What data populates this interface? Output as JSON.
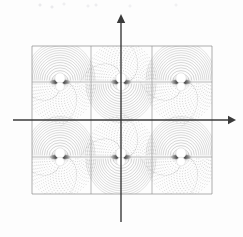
{
  "figure": {
    "title": "",
    "background_color": "#fdfdfd",
    "width": 243,
    "height": 237
  },
  "axes": {
    "color": "#3a3a3a",
    "x_axis": {
      "name": "horizontal-axis",
      "label": "",
      "y": 120,
      "x_start": 13,
      "x_end": 236,
      "arrow": "right"
    },
    "y_axis": {
      "name": "vertical-axis",
      "label": "",
      "x": 121,
      "y_start": 222,
      "y_end": 14,
      "arrow": "up"
    }
  },
  "lattice": {
    "name": "unit-cell-grid",
    "border_color": "#8a8a8a",
    "grid_color": "#9a9a9a",
    "x_bounds": [
      32,
      91,
      152,
      212
    ],
    "y_bounds": [
      46,
      82,
      157,
      194
    ],
    "columns": 3,
    "rows": 3,
    "mid_row_split_y": 120
  },
  "chart_data": {
    "type": "contour",
    "title": "",
    "subtitle": "",
    "xlabel": "",
    "ylabel": "",
    "grid": true,
    "legend": null,
    "contour_style": {
      "solid_line_color": "#9b9b9b",
      "dotted_line_color": "#8f8f8f",
      "core_dark_color": "#1a1a1a",
      "disk_fill": "#ffffff",
      "line_width": 0.5
    },
    "dipole_sites": [
      {
        "id": "site-0",
        "col": 0,
        "row": 0,
        "cx": 60,
        "cy": 82,
        "polarity": "up",
        "contour_style_above": "solid",
        "contour_style_below": "dotted"
      },
      {
        "id": "site-1",
        "col": 1,
        "row": 0,
        "cx": 121,
        "cy": 82,
        "polarity": "down",
        "contour_style_above": "dotted",
        "contour_style_below": "solid"
      },
      {
        "id": "site-2",
        "col": 2,
        "row": 0,
        "cx": 181,
        "cy": 82,
        "polarity": "up",
        "contour_style_above": "solid",
        "contour_style_below": "dotted"
      },
      {
        "id": "site-3",
        "col": 0,
        "row": 1,
        "cx": 60,
        "cy": 157,
        "polarity": "up",
        "contour_style_above": "solid",
        "contour_style_below": "dotted"
      },
      {
        "id": "site-4",
        "col": 1,
        "row": 1,
        "cx": 121,
        "cy": 157,
        "polarity": "down",
        "contour_style_above": "dotted",
        "contour_style_below": "solid"
      },
      {
        "id": "site-5",
        "col": 2,
        "row": 1,
        "cx": 181,
        "cy": 157,
        "polarity": "up",
        "contour_style_above": "solid",
        "contour_style_below": "dotted"
      }
    ],
    "dipole_geometry": {
      "upper_disk_radius": 5.2,
      "lower_disk_radius": 4.4,
      "upper_disk_dy": -4.0,
      "lower_disk_dy": 4.6,
      "lobe_half_width": 9,
      "lobe_half_height": 2.2
    },
    "contour_levels": 14,
    "xlim": [
      32,
      212
    ],
    "ylim": [
      46,
      194
    ]
  }
}
